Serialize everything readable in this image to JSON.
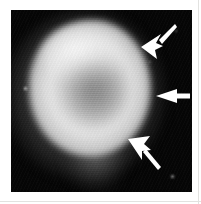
{
  "figure": {
    "type": "grayscale-scintigraphy-scan",
    "caption": "",
    "background_color": "#050505",
    "page_color": "#ffffff",
    "frame": {
      "x": 11,
      "y": 10,
      "width": 181,
      "height": 182
    }
  },
  "lesion": {
    "label": "bright rounded uptake mass with photopenic centre",
    "center_x": 79,
    "center_y": 78,
    "width": 122,
    "height": 136,
    "rim_color": "#ececec",
    "core_color": "#8c8c8c",
    "tail_label": "faint inferior extension"
  },
  "annotations": {
    "arrow_color": "#ffffff",
    "arrows": [
      {
        "name": "arrow-upper",
        "label": "upper arrow",
        "direction": "down-left",
        "tail_x": 172,
        "tail_y": 22,
        "tip_x": 141,
        "tip_y": 47
      },
      {
        "name": "arrow-middle",
        "label": "middle arrow",
        "direction": "left",
        "tail_x": 189,
        "tail_y": 96,
        "tip_x": 156,
        "tip_y": 96
      },
      {
        "name": "arrow-lower",
        "label": "lower arrow",
        "direction": "up-left",
        "tail_x": 158,
        "tail_y": 172,
        "tip_x": 128,
        "tip_y": 139
      }
    ]
  },
  "specks": [
    {
      "name": "speck-left",
      "x": 25,
      "y": 88,
      "size": 3
    },
    {
      "name": "speck-upper-right",
      "x": 176,
      "y": 31,
      "size": 2
    },
    {
      "name": "speck-lower-right",
      "x": 172,
      "y": 176,
      "size": 3
    },
    {
      "name": "speck-mid-right",
      "x": 150,
      "y": 62,
      "size": 2
    }
  ]
}
